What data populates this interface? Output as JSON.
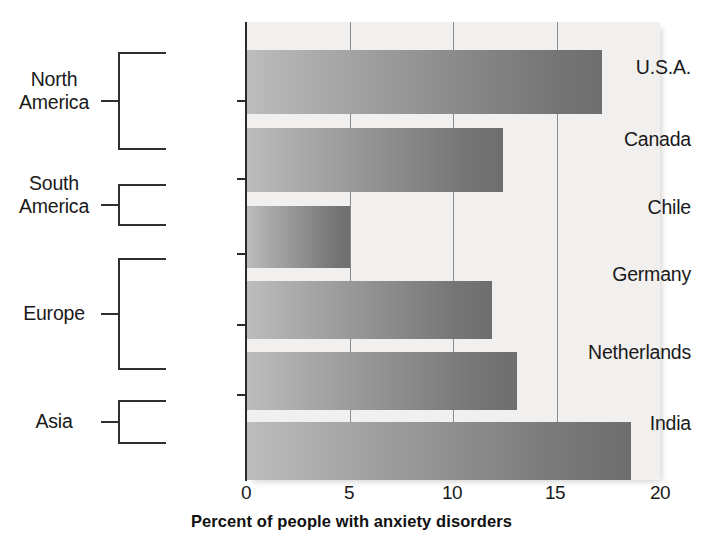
{
  "chart_data": {
    "type": "bar",
    "orientation": "horizontal",
    "title": "",
    "xlabel": "Percent of people with anxiety disorders",
    "ylabel": "",
    "xlim": [
      0,
      20
    ],
    "xticks": [
      "0",
      "5",
      "10",
      "15",
      "20"
    ],
    "xtick_values": [
      0,
      5,
      10,
      15,
      20
    ],
    "grid": "vertical gridlines at 5, 10, 15",
    "legend": "none",
    "categories": [
      "U.S.A.",
      "Canada",
      "Chile",
      "Germany",
      "Netherlands",
      "India"
    ],
    "values": [
      17.2,
      12.4,
      5.0,
      11.9,
      13.1,
      18.6
    ],
    "groups": [
      {
        "region": "North America",
        "region_lines": [
          "North",
          "America"
        ],
        "members": [
          "U.S.A.",
          "Canada"
        ]
      },
      {
        "region": "South America",
        "region_lines": [
          "South",
          "America"
        ],
        "members": [
          "Chile"
        ]
      },
      {
        "region": "Europe",
        "region_lines": [
          "Europe"
        ],
        "members": [
          "Germany",
          "Netherlands"
        ]
      },
      {
        "region": "Asia",
        "region_lines": [
          "Asia"
        ],
        "members": [
          "India"
        ]
      }
    ],
    "bar_color_start": "#bdbdbd",
    "bar_color_end": "#6e6e6e",
    "plot_background": "#f1f0ee",
    "axis_color": "#2a2a2a"
  },
  "axis": {
    "title": "Percent of people with anxiety disorders",
    "ticks": [
      {
        "label": "0"
      },
      {
        "label": "5"
      },
      {
        "label": "10"
      },
      {
        "label": "15"
      },
      {
        "label": "20"
      }
    ]
  },
  "bars": [
    {
      "country": "U.S.A.",
      "value": 17.2
    },
    {
      "country": "Canada",
      "value": 12.4
    },
    {
      "country": "Chile",
      "value": 5.0
    },
    {
      "country": "Germany",
      "value": 11.9
    },
    {
      "country": "Netherlands",
      "value": 13.1
    },
    {
      "country": "India",
      "value": 18.6
    }
  ],
  "regions": [
    {
      "line1": "North",
      "line2": "America"
    },
    {
      "line1": "South",
      "line2": "America"
    },
    {
      "line1": "Europe",
      "line2": ""
    },
    {
      "line1": "Asia",
      "line2": ""
    }
  ]
}
